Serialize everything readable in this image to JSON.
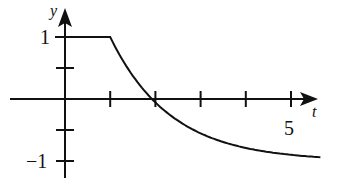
{
  "chart_data": {
    "type": "line",
    "title": "",
    "xlabel": "t",
    "ylabel": "y",
    "x_ticks": [
      1,
      2,
      3,
      4,
      5
    ],
    "x_tick_labels": {
      "5": "5"
    },
    "y_ticks": [
      -1,
      -0.5,
      0.5,
      1
    ],
    "y_tick_labels": {
      "1": "1",
      "-1": "−1"
    },
    "xlim": [
      -1.2,
      5.8
    ],
    "ylim": [
      -1.2,
      1.45
    ],
    "grid": false,
    "legend": null,
    "series": [
      {
        "name": "y(t)",
        "description": "Constant y=1 for 0<=t<=1, then decays toward -1 asymptotically",
        "x": [
          0,
          1,
          1.25,
          1.5,
          1.73,
          2,
          2.5,
          3,
          3.5,
          4,
          4.5,
          5,
          5.6
        ],
        "y": [
          1,
          1,
          0.6,
          0.25,
          0,
          -0.2,
          -0.45,
          -0.62,
          -0.73,
          -0.82,
          -0.88,
          -0.92,
          -0.96
        ]
      }
    ]
  },
  "labels": {
    "y_axis": "y",
    "x_axis": "t",
    "y_one": "1",
    "y_minus_one": "−1",
    "x_five": "5"
  }
}
